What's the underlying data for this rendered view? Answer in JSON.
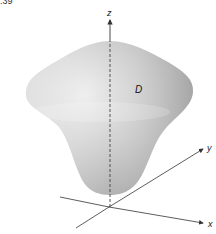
{
  "figure": {
    "number_fragment": ".39",
    "region_label": "D",
    "axes": {
      "x_label": "x",
      "y_label": "y",
      "z_label": "z"
    },
    "colors": {
      "surface_light": "#e6e6e6",
      "surface_mid": "#c8c8c8",
      "surface_dark": "#a9a9a9",
      "axis": "#333333"
    }
  }
}
